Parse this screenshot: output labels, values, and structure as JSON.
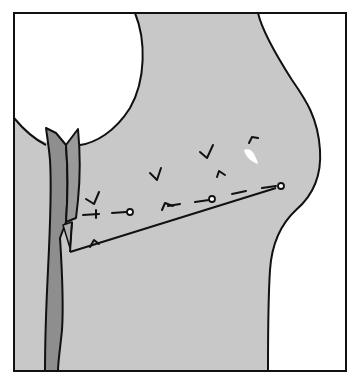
{
  "figure": {
    "type": "surgical-illustration",
    "colors": {
      "background": "#ffffff",
      "tissue": "#c8c8c8",
      "strip": "#8e8e8e",
      "line": "#111111",
      "void": "#ffffff"
    },
    "regions": [
      {
        "name": "tissue-region",
        "fill": "tissue"
      },
      {
        "name": "round-void",
        "fill": "void"
      },
      {
        "name": "right-void",
        "fill": "void"
      },
      {
        "name": "vertical-strip",
        "fill": "strip"
      }
    ],
    "markings": {
      "tick_marks": 8,
      "circle_pins": 3,
      "dashed_lines": 2,
      "flap_lines": 2
    }
  }
}
